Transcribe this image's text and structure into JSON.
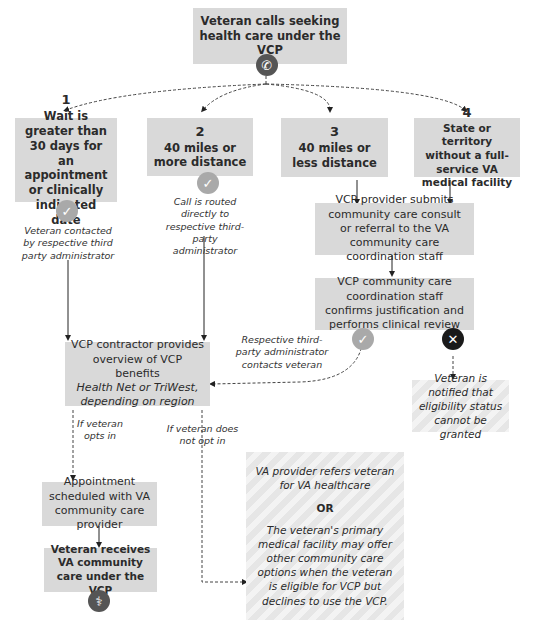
{
  "start": {
    "text": "Veteran calls seeking health care under the VCP",
    "icon": "phone-icon"
  },
  "criteria": [
    {
      "num": "1",
      "text": "Wait is greater than 30 days for an appointment or clinically indicated date",
      "note": "Veteran contacted by respective third party administrator",
      "icon": "check-icon"
    },
    {
      "num": "2",
      "text": "40 miles or more distance",
      "note": "Call is routed directly to respective third-party administrator",
      "icon": "check-icon"
    },
    {
      "num": "3",
      "text": "40 miles or less distance"
    },
    {
      "num": "4",
      "text": "State or territory without a full-service VA medical facility"
    }
  ],
  "provider_submits": "VCP provider submits community care consult or referral to the VA community care coordination staff",
  "coordination_review": "VCP community care coordination staff confirms justification and performs clinical review",
  "approved_note": "Respective third-party administrator contacts veteran",
  "denied_note": "Veteran is notified that eligibility status cannot be granted",
  "contractor": {
    "line1": "VCP contractor provides overview of VCP benefits",
    "line2": "Health Net or TriWest, depending on region"
  },
  "opt_in_label": "If veteran opts in",
  "opt_out_label": "If veteran does not opt in",
  "appointment": "Appointment scheduled with VA community care provider",
  "receives": {
    "text": "Veteran receives VA community care under the VCP",
    "icon": "stethoscope-icon"
  },
  "alternatives": {
    "first": "VA provider refers veteran for VA healthcare",
    "or": "OR",
    "second": "The veteran's primary medical facility may offer other community care options when the veteran is eligible for VCP but declines to use the VCP."
  }
}
